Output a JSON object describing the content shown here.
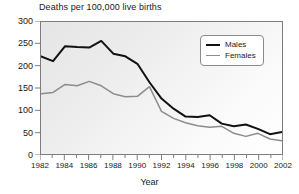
{
  "chart_data": {
    "type": "line",
    "title": "Deaths per 100,000 live births",
    "xlabel": "Year",
    "ylabel": "",
    "xlim": [
      1982,
      2002
    ],
    "ylim": [
      0,
      300
    ],
    "grid": false,
    "legend_position": "top-right",
    "x": [
      1982,
      1983,
      1984,
      1985,
      1986,
      1987,
      1988,
      1989,
      1990,
      1991,
      1992,
      1993,
      1994,
      1995,
      1996,
      1997,
      1998,
      1999,
      2000,
      2001,
      2002
    ],
    "y_ticks": [
      0,
      50,
      100,
      150,
      200,
      250,
      300
    ],
    "y_tick_labels": [
      "0",
      "50",
      "100",
      "150",
      "200",
      "250",
      "300"
    ],
    "x_ticks": [
      1982,
      1984,
      1986,
      1988,
      1990,
      1992,
      1994,
      1996,
      1998,
      2000,
      2002
    ],
    "x_tick_labels": [
      "1982",
      "1984",
      "1986",
      "1988",
      "1990",
      "1992",
      "1994",
      "1996",
      "1998",
      "2000",
      "2002"
    ],
    "x_minor_ticks": [
      1983,
      1985,
      1987,
      1989,
      1991,
      1993,
      1995,
      1997,
      1999,
      2001
    ],
    "series": [
      {
        "name": "Males",
        "color": "#111111",
        "width": 2,
        "values": [
          222,
          211,
          245,
          243,
          242,
          257,
          228,
          222,
          205,
          163,
          126,
          103,
          85,
          84,
          88,
          69,
          63,
          67,
          57,
          45,
          50
        ]
      },
      {
        "name": "Females",
        "color": "#8c8c8c",
        "width": 1.5,
        "values": [
          137,
          140,
          158,
          155,
          165,
          155,
          137,
          130,
          131,
          153,
          97,
          81,
          71,
          64,
          61,
          63,
          47,
          40,
          47,
          34,
          30
        ]
      }
    ]
  },
  "legend": {
    "entries": [
      {
        "label": "Males"
      },
      {
        "label": "Females"
      }
    ]
  },
  "colors": {
    "males": "#111111",
    "females": "#8c8c8c",
    "frame": "#7d7d7d",
    "text": "#1a1a1a",
    "plot_background": "#efefef"
  }
}
